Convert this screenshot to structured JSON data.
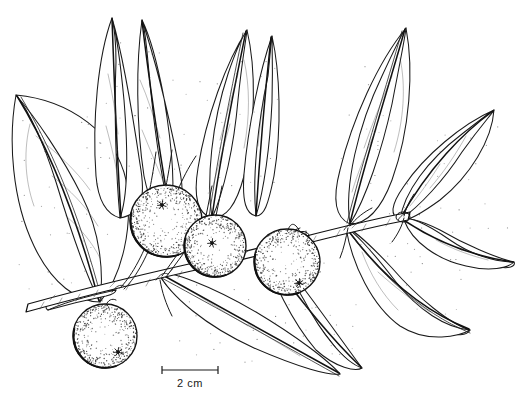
{
  "illustration": {
    "title": "Botanical line drawing of a fruiting branch",
    "subject": "branch with lanceolate leaves and four globose stippled fruits",
    "style": "pen-and-ink stipple line art",
    "background_color": "#ffffff",
    "ink_color": "#111111"
  },
  "scale_bar": {
    "label": "2 cm",
    "x_start": 162,
    "x_end": 218,
    "y": 370,
    "tick_height": 8,
    "label_x": 190,
    "label_y": 387
  },
  "stem": {
    "name": "main-branch-axis",
    "start": [
      28,
      308
    ],
    "end": [
      412,
      214
    ],
    "node_positions": [
      [
        112,
        288
      ],
      [
        158,
        276
      ],
      [
        262,
        246
      ],
      [
        300,
        235
      ],
      [
        345,
        225
      ],
      [
        400,
        216
      ]
    ]
  },
  "fruits": [
    {
      "name": "fruit-upper-left",
      "cx": 166,
      "cy": 221,
      "r": 36,
      "calyx_x": 162,
      "calyx_y": 205,
      "stipple_count": 150
    },
    {
      "name": "fruit-center",
      "cx": 215,
      "cy": 246,
      "r": 31,
      "calyx_x": 212,
      "calyx_y": 243,
      "stipple_count": 120
    },
    {
      "name": "fruit-right",
      "cx": 287,
      "cy": 262,
      "r": 33,
      "calyx_x": 299,
      "calyx_y": 283,
      "stipple_count": 130
    },
    {
      "name": "fruit-lower-left",
      "cx": 105,
      "cy": 336,
      "r": 32,
      "calyx_x": 118,
      "calyx_y": 352,
      "stipple_count": 125
    }
  ],
  "leaves": [
    {
      "name": "leaf-far-left-lower",
      "tip": [
        16,
        95
      ],
      "base": [
        98,
        300
      ],
      "width": 46
    },
    {
      "name": "leaf-upper-left-inner",
      "tip": [
        112,
        18
      ],
      "base": [
        160,
        200
      ],
      "width": 38
    },
    {
      "name": "leaf-upper-mid",
      "tip": [
        140,
        20
      ],
      "base": [
        182,
        208
      ],
      "width": 40
    },
    {
      "name": "leaf-upper-center",
      "tip": [
        240,
        28
      ],
      "base": [
        218,
        214
      ],
      "width": 44
    },
    {
      "name": "leaf-upper-right",
      "tip": [
        268,
        34
      ],
      "base": [
        250,
        216
      ],
      "width": 36
    },
    {
      "name": "leaf-right-upper",
      "tip": [
        404,
        28
      ],
      "base": [
        348,
        222
      ],
      "width": 42
    },
    {
      "name": "leaf-right-outer",
      "tip": [
        492,
        112
      ],
      "base": [
        404,
        216
      ],
      "width": 40
    },
    {
      "name": "leaf-lower-center",
      "tip": [
        340,
        372
      ],
      "base": [
        160,
        272
      ],
      "width": 48
    },
    {
      "name": "leaf-lower-right-a",
      "tip": [
        360,
        366
      ],
      "base": [
        262,
        246
      ],
      "width": 40
    },
    {
      "name": "leaf-lower-right-b",
      "tip": [
        470,
        330
      ],
      "base": [
        346,
        228
      ],
      "width": 44
    },
    {
      "name": "leaf-lower-right-c",
      "tip": [
        510,
        262
      ],
      "base": [
        404,
        218
      ],
      "width": 38
    },
    {
      "name": "leaf-left-small",
      "tip": [
        52,
        300
      ],
      "base": [
        116,
        290
      ],
      "width": 22
    }
  ],
  "counts": {
    "fruit_count": 4,
    "leaf_count": 12
  }
}
